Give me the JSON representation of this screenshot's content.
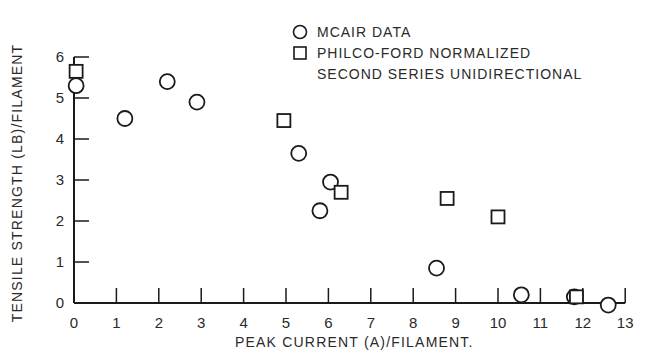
{
  "chart_data": {
    "type": "scatter",
    "title": "",
    "xlabel": "PEAK CURRENT (A)/FILAMENT.",
    "ylabel": "TENSILE STRENGTH (LB)/FILAMENT",
    "xlim": [
      0,
      13
    ],
    "ylim": [
      0,
      6
    ],
    "xticks": [
      0,
      1,
      2,
      3,
      4,
      5,
      6,
      7,
      8,
      9,
      10,
      11,
      12,
      13
    ],
    "yticks": [
      0,
      1,
      2,
      3,
      4,
      5,
      6
    ],
    "grid": false,
    "legend_position": "top-right",
    "legend": [
      {
        "marker": "circle",
        "label": "MCAIR DATA"
      },
      {
        "marker": "square",
        "label": "PHILCO-FORD NORMALIZED",
        "label_line2": "SECOND SERIES UNIDIRECTIONAL"
      }
    ],
    "series": [
      {
        "name": "MCAIR DATA",
        "marker": "circle",
        "points": [
          {
            "x": 0.05,
            "y": 5.3
          },
          {
            "x": 1.2,
            "y": 4.5
          },
          {
            "x": 2.2,
            "y": 5.4
          },
          {
            "x": 2.9,
            "y": 4.9
          },
          {
            "x": 5.3,
            "y": 3.65
          },
          {
            "x": 5.8,
            "y": 2.25
          },
          {
            "x": 6.05,
            "y": 2.95
          },
          {
            "x": 8.55,
            "y": 0.85
          },
          {
            "x": 10.55,
            "y": 0.2
          },
          {
            "x": 11.8,
            "y": 0.15
          },
          {
            "x": 12.6,
            "y": -0.05
          }
        ]
      },
      {
        "name": "PHILCO-FORD NORMALIZED SECOND SERIES UNIDIRECTIONAL",
        "marker": "square",
        "points": [
          {
            "x": 0.05,
            "y": 5.65
          },
          {
            "x": 4.95,
            "y": 4.45
          },
          {
            "x": 6.3,
            "y": 2.7
          },
          {
            "x": 8.8,
            "y": 2.55
          },
          {
            "x": 10.0,
            "y": 2.1
          },
          {
            "x": 11.85,
            "y": 0.15
          }
        ]
      }
    ]
  },
  "style": {
    "ink": "#1a1a1a",
    "background": "#ffffff"
  }
}
